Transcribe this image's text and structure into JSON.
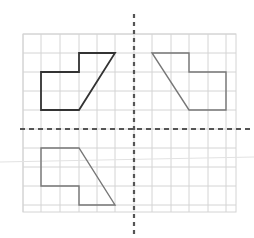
{
  "diagram": {
    "grid": {
      "x_lines": [
        23,
        41,
        60,
        79,
        97,
        115,
        134,
        152,
        171,
        189,
        208,
        226
      ],
      "y_lines": [
        34,
        53,
        72,
        91,
        110,
        129,
        148,
        167,
        186,
        205
      ],
      "left": 23,
      "top": 34,
      "right": 236,
      "bottom": 212,
      "color": "#d4d4d4"
    },
    "axes": {
      "vertical": {
        "x": 134,
        "y1": 14,
        "y2": 238,
        "color": "#555555"
      },
      "horizontal": {
        "y": 129,
        "x1": 20,
        "x2": 254,
        "color": "#555555"
      }
    },
    "shapes": [
      {
        "name": "original-shape",
        "color": "#333333",
        "stroke_width": 1.8,
        "points": "41,72 79,72 79,53 115,53 79,110 41,110"
      },
      {
        "name": "vertical-reflection-shape",
        "color": "#777777",
        "stroke_width": 1.4,
        "points": "152,53 189,53 189,72 226,72 226,110 189,110"
      },
      {
        "name": "horizontal-reflection-shape",
        "color": "#777777",
        "stroke_width": 1.4,
        "points": "41,148 79,148 115,205 79,205 79,186 41,186"
      }
    ],
    "artifact_line": {
      "x1": 0,
      "y1": 162,
      "x2": 254,
      "y2": 157,
      "color": "#e2e2e2"
    }
  }
}
